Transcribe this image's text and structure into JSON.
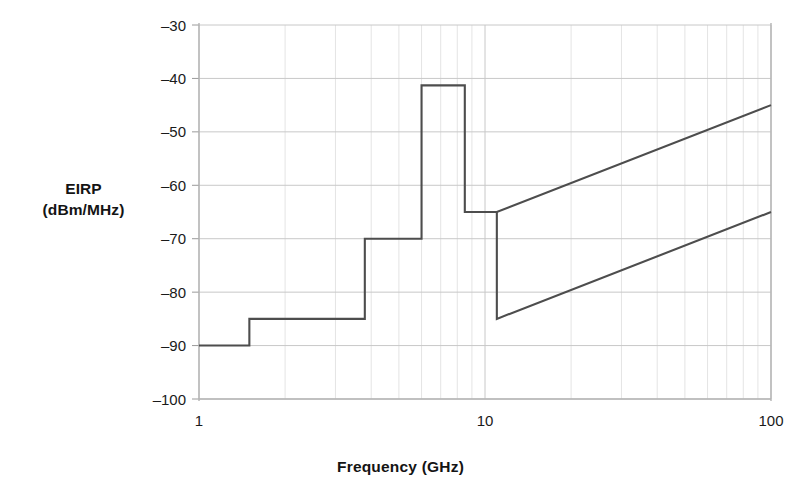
{
  "chart_data": {
    "type": "line",
    "title": "",
    "subtitle": "",
    "xlabel": "Frequency (GHz)",
    "ylabel_line1": "EIRP",
    "ylabel_line2": "(dBm/MHz)",
    "ylabel": "EIRP (dBm/MHz)",
    "xscale": "log",
    "yscale": "linear",
    "xlim": [
      1,
      100
    ],
    "ylim": [
      -100,
      -30
    ],
    "grid": true,
    "legend": null,
    "xticks": [
      1,
      10,
      100
    ],
    "xtick_labels": [
      "1",
      "10",
      "100"
    ],
    "yticks": [
      -30,
      -40,
      -50,
      -60,
      -70,
      -80,
      -90,
      -100
    ],
    "ytick_labels": [
      "–30",
      "–40",
      "–50",
      "–60",
      "–70",
      "–80",
      "–90",
      "–100"
    ],
    "x_minor_ticks": [
      2,
      3,
      4,
      5,
      6,
      7,
      8,
      9,
      20,
      30,
      40,
      50,
      60,
      70,
      80,
      90
    ],
    "line_color": "#4d4d4d",
    "grid_color": "#c8c8c8",
    "axis_color": "#b4b4b4",
    "series": [
      {
        "name": "UWB indoor emission mask (step + upper slope)",
        "style": "step-then-slope",
        "points": [
          {
            "f": 1.0,
            "eirp": -90
          },
          {
            "f": 1.5,
            "eirp": -90
          },
          {
            "f": 1.5,
            "eirp": -85
          },
          {
            "f": 3.8,
            "eirp": -85
          },
          {
            "f": 3.8,
            "eirp": -70
          },
          {
            "f": 6.0,
            "eirp": -70
          },
          {
            "f": 6.0,
            "eirp": -41.3
          },
          {
            "f": 8.5,
            "eirp": -41.3
          },
          {
            "f": 8.5,
            "eirp": -65
          },
          {
            "f": 11.0,
            "eirp": -65
          },
          {
            "f": 100.0,
            "eirp": -45
          }
        ]
      },
      {
        "name": "Lower slope branch",
        "style": "slope",
        "points": [
          {
            "f": 11.0,
            "eirp": -65
          },
          {
            "f": 11.0,
            "eirp": -85
          },
          {
            "f": 100.0,
            "eirp": -65
          }
        ]
      }
    ]
  },
  "geometry": {
    "plot_left": 199,
    "plot_right": 771,
    "plot_top": 25,
    "plot_bottom": 399
  }
}
